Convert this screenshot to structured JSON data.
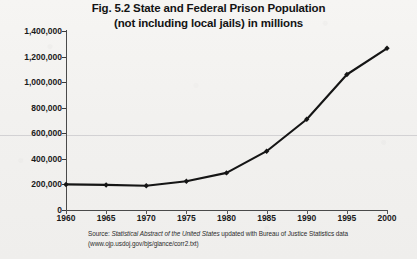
{
  "figure": {
    "title_line1": "Fig. 5.2 State and Federal Prison Population",
    "title_line2": "(not including local jails) in millions",
    "source_prefix": "Source:",
    "source_italic": "Statistical Abstract of the United States",
    "source_rest": "updated with Bureau of Justice Statistics data",
    "source_url": "(www.ojp.usdoj.gov/bjs/glance/corr2.txt)"
  },
  "colors": {
    "paper": "#f3f2f0",
    "ink": "#1a1a1a",
    "line": "#151515",
    "axis": "#4a4a4a",
    "gridline": "#8c8c96"
  },
  "chart_data": {
    "type": "line",
    "title": "Fig. 5.2 State and Federal Prison Population (not including local jails) in millions",
    "xlabel": "",
    "ylabel": "",
    "x": [
      1960,
      1965,
      1970,
      1975,
      1980,
      1985,
      1990,
      1995,
      2000
    ],
    "values": [
      200000,
      196000,
      190000,
      225000,
      290000,
      460000,
      710000,
      1060000,
      1265000
    ],
    "xtick_labels": [
      "1960",
      "1965",
      "1970",
      "1975",
      "1980",
      "1985",
      "1990",
      "1995",
      "2000"
    ],
    "ytick_labels": [
      "0",
      "200,000",
      "400,000",
      "600,000",
      "800,000",
      "1,000,000",
      "1,200,000",
      "1,400,000"
    ],
    "ytick_values": [
      0,
      200000,
      400000,
      600000,
      800000,
      1000000,
      1200000,
      1400000
    ],
    "xlim": [
      1960,
      2000
    ],
    "ylim": [
      0,
      1400000
    ],
    "grid": "single horizontal rule at 600,000",
    "legend": "none",
    "marker": "diamond",
    "series_name": "State and Federal prison population"
  }
}
